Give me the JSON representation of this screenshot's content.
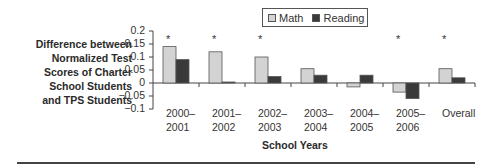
{
  "chart_data": {
    "type": "bar",
    "title": "",
    "ylabel": "Difference between Normalized Test Scores of Charter School Students and TPS Students",
    "ylabel_lines": [
      "Difference between",
      "Normalized Test",
      "Scores of Charter",
      "School Students",
      "and TPS Students"
    ],
    "xlabel": "School Years",
    "categories": [
      "2000–2001",
      "2001–2002",
      "2002–2003",
      "2003–2004",
      "2004–2005",
      "2005–2006",
      "Overall"
    ],
    "category_lines": [
      [
        "2000–",
        "2001"
      ],
      [
        "2001–",
        "2002"
      ],
      [
        "2002–",
        "2003"
      ],
      [
        "2003–",
        "2004"
      ],
      [
        "2004–",
        "2005"
      ],
      [
        "2005–",
        "2006"
      ],
      [
        "Overall",
        ""
      ]
    ],
    "series": [
      {
        "name": "Math",
        "color": "#d3d3d3",
        "values": [
          0.14,
          0.12,
          0.1,
          0.055,
          -0.015,
          -0.035,
          0.055
        ]
      },
      {
        "name": "Reading",
        "color": "#3a3a3a",
        "values": [
          0.09,
          0.003,
          0.025,
          0.03,
          0.03,
          -0.06,
          0.02
        ]
      }
    ],
    "significance_markers": [
      "*",
      "*",
      "*",
      "",
      "",
      "*",
      "*"
    ],
    "ylim": [
      -0.1,
      0.2
    ],
    "yticks": [
      "0.2",
      "0.15",
      "0.1",
      "0.05",
      "0",
      "−0.05",
      "−0.1"
    ],
    "grid": false,
    "legend_position": "top"
  },
  "legend": {
    "math": "Math",
    "reading": "Reading"
  },
  "axis": {
    "xtitle": "School Years"
  }
}
